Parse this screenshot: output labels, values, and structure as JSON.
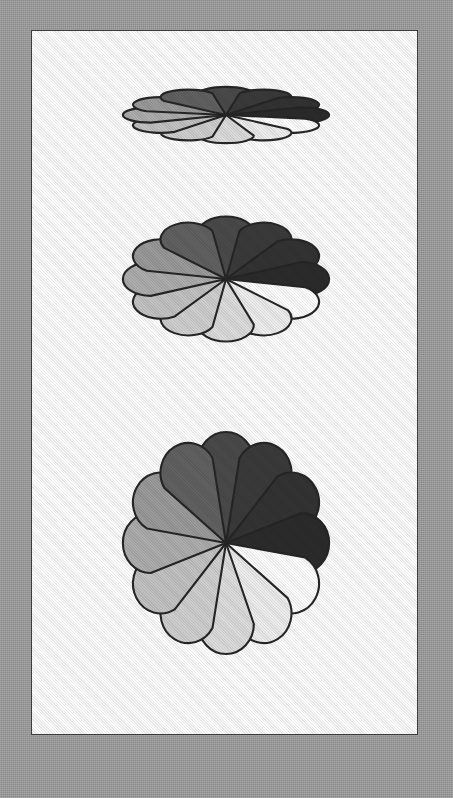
{
  "figure": {
    "background_color": "#9b9b9b",
    "page_color": "#fdfdfd",
    "page_border_color": "#3b3b3b",
    "outline_color": "#262626"
  },
  "rosette": {
    "petal_count": 12,
    "start_angle_deg": -90,
    "petal_colors": [
      "#4a4a4a",
      "#3a3a3a",
      "#333333",
      "#2b2b2b",
      "#ffffff",
      "#ededed",
      "#dcdcdc",
      "#cfcfcf",
      "#c2c2c2",
      "#adadad",
      "#9a9a9a",
      "#616161"
    ],
    "petal_labels": [
      "petal-12-oclock-left",
      "petal-1-oclock",
      "petal-2-oclock",
      "petal-3-oclock-darkest",
      "petal-3-oclock-white",
      "petal-4-oclock",
      "petal-5-oclock",
      "petal-6-oclock-right",
      "petal-6-oclock-left",
      "petal-7-oclock",
      "petal-8-oclock",
      "petal-10-oclock"
    ]
  },
  "panels": [
    {
      "name": "top-rosette",
      "label": "Rosette compressed vertically",
      "top": 48,
      "width": 264,
      "height": 72,
      "aspect_note": "flattened"
    },
    {
      "name": "middle-rosette",
      "label": "Rosette at intermediate vertical scale",
      "top": 168,
      "width": 264,
      "height": 160,
      "aspect_note": "intermediate"
    },
    {
      "name": "bottom-rosette",
      "label": "Rosette at full vertical scale",
      "top": 370,
      "width": 264,
      "height": 284,
      "aspect_note": "full"
    }
  ]
}
